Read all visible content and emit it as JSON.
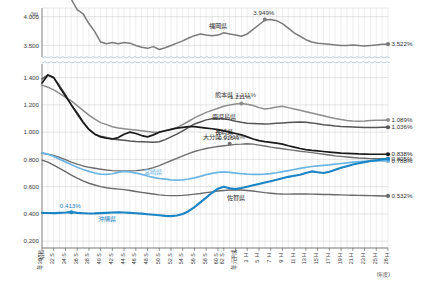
{
  "chart_data": {
    "type": "line",
    "title": "",
    "xlabel": "(年度)",
    "ylabel": "(%)",
    "unit_label": "(%)",
    "xaxis_note": "(年度)",
    "grid": true,
    "legend_position": "inline-labels",
    "broken_axis": true,
    "yticks_upper": [
      "4.000",
      "3.500"
    ],
    "yticks_lower": [
      "1.400",
      "1.200",
      "1.000",
      "0.800",
      "0.600",
      "0.400",
      "0.200"
    ],
    "ylim_upper": [
      3.3,
      4.15
    ],
    "ylim_lower": [
      0.15,
      1.5
    ],
    "x_tick_labels": [
      "昭和30年",
      "S32",
      "S34",
      "S36",
      "S38",
      "S40",
      "S42",
      "S44",
      "S46",
      "S48",
      "S50",
      "S52",
      "S54",
      "S56",
      "S58",
      "S60",
      "S62",
      "平成元年",
      "H3",
      "H5",
      "H7",
      "H9",
      "H11",
      "H13",
      "H15",
      "H17",
      "H19",
      "H21",
      "H23",
      "H25",
      "H26"
    ],
    "x_tick_labels_display": [
      {
        "top": "昭和",
        "mid": "30",
        "bot": "年"
      },
      {
        "top": "S",
        "mid": "32",
        "bot": ""
      },
      {
        "top": "S",
        "mid": "34",
        "bot": ""
      },
      {
        "top": "S",
        "mid": "36",
        "bot": ""
      },
      {
        "top": "S",
        "mid": "38",
        "bot": ""
      },
      {
        "top": "S",
        "mid": "40",
        "bot": ""
      },
      {
        "top": "S",
        "mid": "42",
        "bot": ""
      },
      {
        "top": "S",
        "mid": "44",
        "bot": ""
      },
      {
        "top": "S",
        "mid": "46",
        "bot": ""
      },
      {
        "top": "S",
        "mid": "48",
        "bot": ""
      },
      {
        "top": "S",
        "mid": "50",
        "bot": ""
      },
      {
        "top": "S",
        "mid": "52",
        "bot": ""
      },
      {
        "top": "S",
        "mid": "54",
        "bot": ""
      },
      {
        "top": "S",
        "mid": "56",
        "bot": ""
      },
      {
        "top": "S",
        "mid": "58",
        "bot": ""
      },
      {
        "top": "S",
        "mid": "60",
        "bot": ""
      },
      {
        "top": "S",
        "mid": "62",
        "bot": ""
      },
      {
        "top": "平成",
        "mid": "元",
        "bot": "年"
      },
      {
        "top": "H",
        "mid": "3",
        "bot": ""
      },
      {
        "top": "H",
        "mid": "5",
        "bot": ""
      },
      {
        "top": "H",
        "mid": "7",
        "bot": ""
      },
      {
        "top": "H",
        "mid": "9",
        "bot": ""
      },
      {
        "top": "H",
        "mid": "11",
        "bot": ""
      },
      {
        "top": "H",
        "mid": "13",
        "bot": ""
      },
      {
        "top": "H",
        "mid": "15",
        "bot": ""
      },
      {
        "top": "H",
        "mid": "17",
        "bot": ""
      },
      {
        "top": "H",
        "mid": "19",
        "bot": ""
      },
      {
        "top": "H",
        "mid": "21",
        "bot": ""
      },
      {
        "top": "H",
        "mid": "23",
        "bot": ""
      },
      {
        "top": "H",
        "mid": "25",
        "bot": ""
      },
      {
        "top": "H",
        "mid": "26",
        "bot": ""
      }
    ],
    "series": [
      {
        "name": "福岡県",
        "label": "福岡県",
        "color": "#7b7b7b",
        "panel": "upper",
        "width": 1.5,
        "annotations": [
          {
            "text": "4.453%",
            "x_index": 2,
            "value": 4.453
          },
          {
            "text": "3.949%",
            "x_index": 38,
            "value": 3.949
          }
        ],
        "end_value_label": "3.522%",
        "end_value": 3.522,
        "label_pos": {
          "x_index": 30,
          "value": 3.8
        },
        "values": [
          4.4,
          4.43,
          4.453,
          4.42,
          4.36,
          4.3,
          4.12,
          4.05,
          3.88,
          3.74,
          3.56,
          3.53,
          3.55,
          3.53,
          3.55,
          3.54,
          3.5,
          3.47,
          3.45,
          3.48,
          3.43,
          3.46,
          3.5,
          3.54,
          3.58,
          3.63,
          3.67,
          3.7,
          3.68,
          3.67,
          3.68,
          3.72,
          3.7,
          3.68,
          3.66,
          3.7,
          3.78,
          3.86,
          3.94,
          3.949,
          3.93,
          3.88,
          3.8,
          3.72,
          3.66,
          3.6,
          3.56,
          3.54,
          3.53,
          3.52,
          3.51,
          3.5,
          3.5,
          3.51,
          3.5,
          3.49,
          3.5,
          3.51,
          3.52,
          3.522
        ]
      },
      {
        "name": "熊本県",
        "label": "熊本県",
        "color": "#8d8d8d",
        "panel": "lower",
        "width": 1.5,
        "annotations": [
          {
            "text": "1.211%",
            "x_index": 34,
            "value": 1.211
          }
        ],
        "end_value_label": "1.089%",
        "end_value": 1.089,
        "label_pos": {
          "x_index": 31,
          "value": 1.255
        },
        "values": [
          1.345,
          1.33,
          1.31,
          1.285,
          1.255,
          1.23,
          1.195,
          1.16,
          1.125,
          1.095,
          1.07,
          1.055,
          1.04,
          1.03,
          1.025,
          1.02,
          1.015,
          1.01,
          1.005,
          1.0,
          1.002,
          1.01,
          1.02,
          1.035,
          1.055,
          1.08,
          1.105,
          1.125,
          1.145,
          1.16,
          1.175,
          1.19,
          1.2,
          1.206,
          1.211,
          1.205,
          1.195,
          1.18,
          1.17,
          1.175,
          1.185,
          1.19,
          1.18,
          1.17,
          1.16,
          1.15,
          1.14,
          1.13,
          1.12,
          1.11,
          1.1,
          1.092,
          1.086,
          1.082,
          1.08,
          1.082,
          1.085,
          1.087,
          1.088,
          1.089
        ]
      },
      {
        "name": "鹿児島県",
        "label": "鹿児島県",
        "color": "#555555",
        "panel": "lower",
        "width": 1.5,
        "annotations": [],
        "end_value_label": "1.036%",
        "end_value": 1.036,
        "label_pos": {
          "x_index": 31,
          "value": 1.095
        },
        "values": [
          1.39,
          1.42,
          1.4,
          1.34,
          1.275,
          1.2,
          1.13,
          1.07,
          1.02,
          0.985,
          0.97,
          0.96,
          0.95,
          0.945,
          0.94,
          0.935,
          0.932,
          0.93,
          0.928,
          0.925,
          0.93,
          0.945,
          0.965,
          0.985,
          1.01,
          1.035,
          1.06,
          1.075,
          1.09,
          1.098,
          1.1,
          1.098,
          1.09,
          1.08,
          1.072,
          1.066,
          1.064,
          1.062,
          1.06,
          1.062,
          1.065,
          1.068,
          1.07,
          1.072,
          1.074,
          1.072,
          1.068,
          1.062,
          1.055,
          1.05,
          1.045,
          1.042,
          1.04,
          1.038,
          1.036,
          1.035,
          1.034,
          1.035,
          1.036,
          1.036
        ]
      },
      {
        "name": "長崎県",
        "label": "長崎県",
        "color": "#1a1a1a",
        "panel": "lower",
        "width": 1.7,
        "annotations": [],
        "end_value_label": "0.838%",
        "end_value": 0.838,
        "label_pos": {
          "x_index": 31,
          "value": 0.985
        },
        "values": [
          1.36,
          1.42,
          1.4,
          1.33,
          1.265,
          1.2,
          1.14,
          1.075,
          1.02,
          0.985,
          0.965,
          0.955,
          0.95,
          0.96,
          0.985,
          1.0,
          0.99,
          0.975,
          0.965,
          0.98,
          1.0,
          1.01,
          1.02,
          1.03,
          1.035,
          1.04,
          1.04,
          1.035,
          1.03,
          1.025,
          1.018,
          1.01,
          1.0,
          0.99,
          0.98,
          0.965,
          0.95,
          0.938,
          0.93,
          0.925,
          0.92,
          0.912,
          0.9,
          0.89,
          0.88,
          0.872,
          0.866,
          0.862,
          0.858,
          0.854,
          0.85,
          0.846,
          0.844,
          0.842,
          0.84,
          0.839,
          0.838,
          0.838,
          0.838,
          0.838
        ]
      },
      {
        "name": "大分県",
        "label": "大分県",
        "color": "#6f6f6f",
        "panel": "lower",
        "width": 1.4,
        "annotations": [
          {
            "text": "0.915%",
            "x_index": 32,
            "value": 0.915
          }
        ],
        "end_value_label": "0.805%",
        "end_value": 0.805,
        "label_pos": {
          "x_index": 29,
          "value": 0.95
        },
        "values": [
          0.845,
          0.838,
          0.83,
          0.815,
          0.798,
          0.78,
          0.765,
          0.752,
          0.742,
          0.735,
          0.728,
          0.722,
          0.718,
          0.716,
          0.715,
          0.716,
          0.718,
          0.722,
          0.728,
          0.74,
          0.755,
          0.772,
          0.79,
          0.808,
          0.826,
          0.842,
          0.858,
          0.87,
          0.88,
          0.888,
          0.895,
          0.9,
          0.905,
          0.91,
          0.912,
          0.915,
          0.912,
          0.905,
          0.898,
          0.89,
          0.884,
          0.878,
          0.872,
          0.866,
          0.86,
          0.855,
          0.85,
          0.844,
          0.838,
          0.832,
          0.826,
          0.822,
          0.818,
          0.814,
          0.81,
          0.808,
          0.806,
          0.805,
          0.805,
          0.805
        ]
      },
      {
        "name": "宮崎県",
        "label": "宮崎県",
        "color": "#6cb6e3",
        "panel": "lower",
        "width": 1.7,
        "annotations": [],
        "end_value_label": "0.788%",
        "end_value": 0.788,
        "label_pos": {
          "x_index": 19,
          "value": 0.69
        },
        "values": [
          0.85,
          0.838,
          0.822,
          0.802,
          0.782,
          0.762,
          0.742,
          0.726,
          0.712,
          0.7,
          0.692,
          0.69,
          0.695,
          0.705,
          0.712,
          0.708,
          0.7,
          0.69,
          0.678,
          0.668,
          0.66,
          0.655,
          0.65,
          0.648,
          0.65,
          0.656,
          0.665,
          0.676,
          0.688,
          0.698,
          0.705,
          0.708,
          0.705,
          0.7,
          0.695,
          0.692,
          0.69,
          0.69,
          0.692,
          0.696,
          0.702,
          0.71,
          0.718,
          0.726,
          0.734,
          0.742,
          0.748,
          0.752,
          0.756,
          0.76,
          0.765,
          0.77,
          0.775,
          0.78,
          0.784,
          0.786,
          0.788,
          0.788,
          0.79,
          0.788
        ]
      },
      {
        "name": "佐賀県",
        "label": "佐賀県",
        "color": "#6a6a6a",
        "panel": "lower",
        "width": 1.4,
        "annotations": [],
        "end_value_label": "0.532%",
        "end_value": 0.532,
        "label_pos": {
          "x_index": 33,
          "value": 0.505
        },
        "values": [
          0.795,
          0.78,
          0.758,
          0.735,
          0.71,
          0.685,
          0.662,
          0.642,
          0.625,
          0.612,
          0.6,
          0.592,
          0.586,
          0.582,
          0.578,
          0.572,
          0.565,
          0.558,
          0.552,
          0.546,
          0.54,
          0.536,
          0.534,
          0.534,
          0.536,
          0.54,
          0.545,
          0.55,
          0.556,
          0.562,
          0.568,
          0.572,
          0.575,
          0.576,
          0.575,
          0.572,
          0.568,
          0.562,
          0.556,
          0.552,
          0.548,
          0.546,
          0.545,
          0.546,
          0.547,
          0.546,
          0.545,
          0.544,
          0.543,
          0.542,
          0.541,
          0.54,
          0.538,
          0.537,
          0.536,
          0.535,
          0.534,
          0.533,
          0.532,
          0.532
        ]
      },
      {
        "name": "沖縄県",
        "label": "沖縄県",
        "color": "#1b84c4",
        "panel": "lower",
        "width": 2.1,
        "annotations": [
          {
            "text": "0.413%",
            "x_index": 5,
            "value": 0.413
          }
        ],
        "end_value_label": "0.788%",
        "end_value": 0.8,
        "label_pos": {
          "x_index": 11,
          "value": 0.345
        },
        "values": [
          0.408,
          0.407,
          0.406,
          0.408,
          0.41,
          0.413,
          0.408,
          0.405,
          0.403,
          0.404,
          0.406,
          0.408,
          0.41,
          0.412,
          0.41,
          0.408,
          0.405,
          0.402,
          0.398,
          0.394,
          0.39,
          0.386,
          0.384,
          0.388,
          0.4,
          0.42,
          0.45,
          0.485,
          0.52,
          0.555,
          0.585,
          0.6,
          0.588,
          0.582,
          0.59,
          0.6,
          0.61,
          0.62,
          0.63,
          0.64,
          0.65,
          0.662,
          0.672,
          0.68,
          0.688,
          0.7,
          0.712,
          0.706,
          0.7,
          0.71,
          0.724,
          0.738,
          0.75,
          0.762,
          0.772,
          0.78,
          0.788,
          0.794,
          0.8,
          0.805
        ]
      }
    ]
  }
}
